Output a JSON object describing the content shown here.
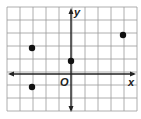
{
  "diagram": {
    "type": "coordinate-plane",
    "grid": {
      "columns": 10,
      "rows": 8,
      "cell_px": 13,
      "left": 7,
      "top": 7,
      "line_color": "#9a9a9a"
    },
    "origin_grid": {
      "col": 5,
      "row": 5
    },
    "axes": {
      "x_label": "x",
      "y_label": "y",
      "origin_label": "O",
      "color": "#222222"
    },
    "points": [
      {
        "label": "A",
        "x": -3,
        "y": 2
      },
      {
        "label": "B",
        "x": 0,
        "y": 1
      },
      {
        "label": "C",
        "x": 4,
        "y": 3
      },
      {
        "label": "D",
        "x": -3,
        "y": -1
      }
    ],
    "point_color": "#111111"
  }
}
